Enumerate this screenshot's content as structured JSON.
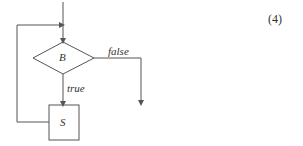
{
  "diagram": {
    "equation_number": "(4)",
    "decision_label": "B",
    "statement_label": "S",
    "true_label": "true",
    "false_label": "false",
    "colors": {
      "stroke": "#555555",
      "text": "#333333"
    }
  }
}
